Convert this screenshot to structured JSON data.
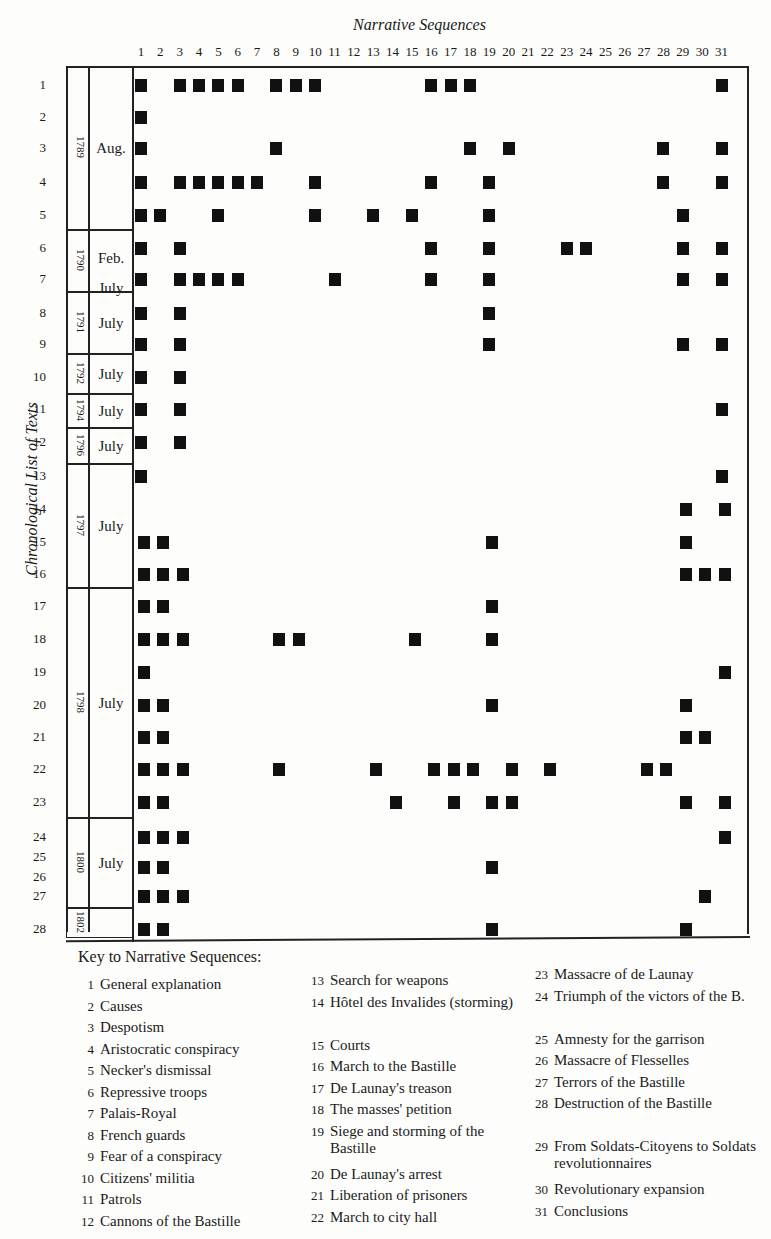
{
  "chart_data": {
    "type": "table",
    "title": "Narrative Sequences",
    "xlabel": "Narrative Sequences",
    "ylabel": "Chronological List of Texts",
    "columns": [
      1,
      2,
      3,
      4,
      5,
      6,
      7,
      8,
      9,
      10,
      11,
      12,
      13,
      14,
      15,
      16,
      17,
      18,
      19,
      20,
      21,
      22,
      23,
      24,
      25,
      26,
      27,
      28,
      29,
      30,
      31
    ],
    "rows": [
      {
        "text": "1",
        "year": "1789",
        "month": "Aug.",
        "sequences": [
          1,
          3,
          4,
          5,
          6,
          8,
          9,
          10,
          16,
          17,
          18,
          31
        ]
      },
      {
        "text": "2",
        "year": "1789",
        "month": "Aug.",
        "sequences": [
          1
        ]
      },
      {
        "text": "3",
        "year": "1789",
        "month": "Aug.",
        "sequences": [
          1,
          8,
          18,
          20,
          28,
          31
        ]
      },
      {
        "text": "4",
        "year": "1789",
        "month": "Aug.",
        "sequences": [
          1,
          3,
          4,
          5,
          6,
          7,
          10,
          16,
          19,
          28,
          31
        ]
      },
      {
        "text": "5",
        "year": "1789",
        "month": "Aug.",
        "sequences": [
          1,
          2,
          5,
          10,
          13,
          15,
          19,
          29
        ]
      },
      {
        "text": "6",
        "year": "1790",
        "month": "Feb.",
        "sequences": [
          1,
          3,
          16,
          19,
          23,
          24,
          29,
          31
        ]
      },
      {
        "text": "7",
        "year": "1790",
        "month": "July",
        "sequences": [
          1,
          3,
          4,
          5,
          6,
          11,
          16,
          19,
          29,
          31
        ]
      },
      {
        "text": "8",
        "year": "1791",
        "month": "July",
        "sequences": [
          1,
          3,
          19
        ]
      },
      {
        "text": "9",
        "year": "1791",
        "month": "July",
        "sequences": [
          1,
          3,
          19,
          29,
          31
        ]
      },
      {
        "text": "10",
        "year": "1792",
        "month": "July",
        "sequences": [
          1,
          3
        ]
      },
      {
        "text": "11",
        "year": "1794",
        "month": "July",
        "sequences": [
          1,
          3,
          31
        ]
      },
      {
        "text": "12",
        "year": "1796",
        "month": "July",
        "sequences": [
          1,
          3
        ]
      },
      {
        "text": "13",
        "year": "1797",
        "month": "July",
        "sequences": [
          1,
          31
        ]
      },
      {
        "text": "14",
        "year": "1797",
        "month": "July",
        "sequences": [
          29,
          31
        ]
      },
      {
        "text": "15",
        "year": "1797",
        "month": "July",
        "sequences": [
          1,
          2,
          19,
          29
        ]
      },
      {
        "text": "16",
        "year": "1797",
        "month": "July",
        "sequences": [
          1,
          2,
          3,
          29,
          30,
          31
        ]
      },
      {
        "text": "17",
        "year": "1798",
        "month": "July",
        "sequences": [
          1,
          2,
          19
        ]
      },
      {
        "text": "18",
        "year": "1798",
        "month": "July",
        "sequences": [
          1,
          2,
          3,
          8,
          9,
          15,
          19
        ]
      },
      {
        "text": "19",
        "year": "1798",
        "month": "July",
        "sequences": [
          1,
          31
        ]
      },
      {
        "text": "20",
        "year": "1798",
        "month": "July",
        "sequences": [
          1,
          2,
          19,
          29
        ]
      },
      {
        "text": "21",
        "year": "1798",
        "month": "July",
        "sequences": [
          1,
          2,
          29,
          30
        ]
      },
      {
        "text": "22",
        "year": "1798",
        "month": "July",
        "sequences": [
          1,
          2,
          3,
          8,
          13,
          16,
          17,
          18,
          20,
          22,
          27,
          28
        ]
      },
      {
        "text": "23",
        "year": "1798",
        "month": "July",
        "sequences": [
          1,
          2,
          14,
          17,
          19,
          20,
          29,
          31
        ]
      },
      {
        "text": "24",
        "year": "1800",
        "month": "July",
        "sequences": [
          1,
          2,
          3,
          31
        ]
      },
      {
        "text": "25/26",
        "year": "1800",
        "month": "July",
        "sequences": [
          1,
          2,
          19
        ]
      },
      {
        "text": "27",
        "year": "1800",
        "month": "July",
        "sequences": [
          1,
          2,
          3,
          30
        ]
      },
      {
        "text": "28",
        "year": "1802",
        "month": "",
        "sequences": [
          1,
          2,
          19,
          29
        ]
      }
    ]
  },
  "header": {
    "title": "Narrative Sequences",
    "ylabel": "Chronological List of Texts",
    "columns": [
      "1",
      "2",
      "3",
      "4",
      "5",
      "6",
      "7",
      "8",
      "9",
      "10",
      "11",
      "12",
      "13",
      "14",
      "15",
      "16",
      "17",
      "18",
      "19",
      "20",
      "21",
      "22",
      "23",
      "24",
      "25",
      "26",
      "27",
      "28",
      "29",
      "30",
      "31"
    ]
  },
  "row_labels": [
    {
      "label": "1",
      "y": 86
    },
    {
      "label": "2",
      "y": 118
    },
    {
      "label": "3",
      "y": 149
    },
    {
      "label": "4",
      "y": 183
    },
    {
      "label": "5",
      "y": 216
    },
    {
      "label": "6",
      "y": 249
    },
    {
      "label": "7",
      "y": 280
    },
    {
      "label": "8",
      "y": 314
    },
    {
      "label": "9",
      "y": 345
    },
    {
      "label": "10",
      "y": 378
    },
    {
      "label": "11",
      "y": 410
    },
    {
      "label": "12",
      "y": 443
    },
    {
      "label": "13",
      "y": 477
    },
    {
      "label": "14",
      "y": 510
    },
    {
      "label": "15",
      "y": 543
    },
    {
      "label": "16",
      "y": 575
    },
    {
      "label": "17",
      "y": 607
    },
    {
      "label": "18",
      "y": 640
    },
    {
      "label": "19",
      "y": 673
    },
    {
      "label": "20",
      "y": 706
    },
    {
      "label": "21",
      "y": 738
    },
    {
      "label": "22",
      "y": 770
    },
    {
      "label": "23",
      "y": 803
    },
    {
      "label": "24",
      "y": 838
    },
    {
      "label": "25",
      "y": 858
    },
    {
      "label": "26",
      "y": 878
    },
    {
      "label": "27",
      "y": 897
    },
    {
      "label": "28",
      "y": 930
    }
  ],
  "periods": [
    {
      "year": "1789",
      "month": "Aug.",
      "top": 66,
      "height": 164
    },
    {
      "year": "1790",
      "month": "Feb. July",
      "top": 230,
      "height": 62
    },
    {
      "year": "1791",
      "month": "July",
      "top": 292,
      "height": 62
    },
    {
      "year": "1792",
      "month": "July",
      "top": 354,
      "height": 40
    },
    {
      "year": "1794",
      "month": "July",
      "top": 394,
      "height": 34
    },
    {
      "year": "1796",
      "month": "July",
      "top": 428,
      "height": 36
    },
    {
      "year": "1797",
      "month": "July",
      "top": 464,
      "height": 124
    },
    {
      "year": "1798",
      "month": "July",
      "top": 588,
      "height": 230
    },
    {
      "year": "1800",
      "month": "July",
      "top": 818,
      "height": 90
    },
    {
      "year": "1802",
      "month": "",
      "top": 908,
      "height": 30
    }
  ],
  "key": {
    "title": "Key to Narrative Sequences:",
    "items": [
      {
        "n": "1",
        "label": "General explanation"
      },
      {
        "n": "2",
        "label": "Causes"
      },
      {
        "n": "3",
        "label": "Despotism"
      },
      {
        "n": "4",
        "label": "Aristocratic conspiracy"
      },
      {
        "n": "5",
        "label": "Necker's dismissal"
      },
      {
        "n": "6",
        "label": "Repressive troops"
      },
      {
        "n": "7",
        "label": "Palais-Royal"
      },
      {
        "n": "8",
        "label": "French guards"
      },
      {
        "n": "9",
        "label": "Fear of a conspiracy"
      },
      {
        "n": "10",
        "label": "Citizens' militia"
      },
      {
        "n": "11",
        "label": "Patrols"
      },
      {
        "n": "12",
        "label": "Cannons of the Bastille"
      },
      {
        "n": "13",
        "label": "Search for weapons"
      },
      {
        "n": "14",
        "label": "Hôtel des Invalides (storming)"
      },
      {
        "n": "15",
        "label": "Courts"
      },
      {
        "n": "16",
        "label": "March to the Bastille"
      },
      {
        "n": "17",
        "label": "De Launay's treason"
      },
      {
        "n": "18",
        "label": "The masses' petition"
      },
      {
        "n": "19",
        "label": "Siege and storming of the Bastille"
      },
      {
        "n": "20",
        "label": "De Launay's arrest"
      },
      {
        "n": "21",
        "label": "Liberation of prisoners"
      },
      {
        "n": "22",
        "label": "March to city hall"
      },
      {
        "n": "23",
        "label": "Massacre of de Launay"
      },
      {
        "n": "24",
        "label": "Triumph of the victors of the B."
      },
      {
        "n": "25",
        "label": "Amnesty for the garrison"
      },
      {
        "n": "26",
        "label": "Massacre of Flesselles"
      },
      {
        "n": "27",
        "label": "Terrors of the Bastille"
      },
      {
        "n": "28",
        "label": "Destruction of the Bastille"
      },
      {
        "n": "29",
        "label": "From Soldats-Citoyens to Soldats revolutionnaires"
      },
      {
        "n": "30",
        "label": "Revolutionary expansion"
      },
      {
        "n": "31",
        "label": "Conclusions"
      }
    ]
  },
  "colors": {
    "mark": "#111111",
    "line": "#222222",
    "background": "#fdfdfb"
  }
}
